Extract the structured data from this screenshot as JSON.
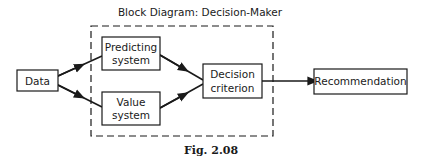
{
  "title": "Block Diagram: Decision-Maker",
  "caption": "Fig. 2.08",
  "nodes": {
    "data": {
      "label": "Data"
    },
    "predicting": {
      "line1": "Predicting",
      "line2": "system"
    },
    "value": {
      "line1": "Value",
      "line2": "system"
    },
    "decision": {
      "line1": "Decision",
      "line2": "criterion"
    },
    "recommendation": {
      "label": "Recommendation"
    }
  },
  "edges": [
    {
      "from": "Data",
      "to": "Predicting system"
    },
    {
      "from": "Data",
      "to": "Value system"
    },
    {
      "from": "Predicting system",
      "to": "Decision criterion"
    },
    {
      "from": "Value system",
      "to": "Decision criterion"
    },
    {
      "from": "Decision criterion",
      "to": "Recommendation"
    }
  ],
  "group": {
    "label": "Decision-Maker",
    "style": "dashed"
  }
}
